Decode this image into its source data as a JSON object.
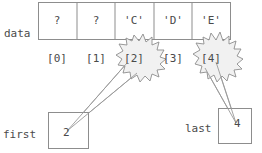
{
  "diagram": {
    "labels": {
      "data": "data",
      "first": "first",
      "last": "last"
    },
    "array": {
      "name": "data",
      "cell_count": 5,
      "cells": [
        {
          "index": "[0]",
          "value": "?"
        },
        {
          "index": "[1]",
          "value": "?"
        },
        {
          "index": "[2]",
          "value": "'C'"
        },
        {
          "index": "[3]",
          "value": "'D'"
        },
        {
          "index": "[4]",
          "value": "'E'"
        }
      ]
    },
    "pointers": [
      {
        "name": "first",
        "label": "first",
        "value": "2",
        "targets_index": "[2]"
      },
      {
        "name": "last",
        "label": "last",
        "value": "4",
        "targets_index": "[4]"
      }
    ],
    "highlights": [
      {
        "shape": "starburst",
        "around_index": "[2]"
      },
      {
        "shape": "starburst",
        "around_index": "[4]"
      }
    ],
    "colors": {
      "stroke": "#8a8a8a",
      "text": "#4a4a4a",
      "background": "#ffffff",
      "starburst_fill": "#f2f2f2"
    }
  }
}
